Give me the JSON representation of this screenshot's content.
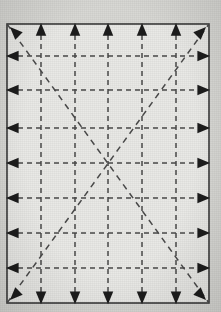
{
  "figure": {
    "canvas": {
      "width": 221,
      "height": 312
    },
    "colors": {
      "page_background": "#d8d8d4",
      "plot_background": "#e9e9e6",
      "border": "#3b3b3b",
      "grid_line": "#4a4a4a",
      "diagonal_line": "#4a4a4a",
      "arrow_fill": "#1d1d1d"
    },
    "frame": {
      "x": 7,
      "y": 24,
      "width": 202,
      "height": 279,
      "border_width": 1.6
    },
    "dash": {
      "pattern": "5 4",
      "width": 1.5
    },
    "diagonal_dash": {
      "pattern": "6 5",
      "width": 1.5
    },
    "grid": {
      "vertical_line_x": [
        41,
        75,
        108,
        142,
        176
      ],
      "horizontal_line_y": [
        56,
        90,
        128,
        163,
        198,
        233,
        268
      ],
      "vertical_count": 5,
      "horizontal_count": 7
    },
    "diagonals": [
      {
        "name": "diagonal-tl-br",
        "x1": 7,
        "y1": 24,
        "x2": 209,
        "y2": 303
      },
      {
        "name": "diagonal-bl-tr",
        "x1": 7,
        "y1": 303,
        "x2": 209,
        "y2": 24
      }
    ],
    "arrows": {
      "size": 7.5,
      "top": {
        "direction": "up",
        "count": 5,
        "glyph": "triangle-up"
      },
      "bottom": {
        "direction": "down",
        "count": 5,
        "glyph": "triangle-down"
      },
      "left": {
        "direction": "left",
        "count": 7,
        "glyph": "triangle-left"
      },
      "right": {
        "direction": "right",
        "count": 7,
        "glyph": "triangle-right"
      },
      "corners": [
        {
          "name": "corner-arrow-top-left",
          "direction": "up-left",
          "angle": 225
        },
        {
          "name": "corner-arrow-top-right",
          "direction": "up-right",
          "angle": 315
        },
        {
          "name": "corner-arrow-bottom-left",
          "direction": "down-left",
          "angle": 135
        },
        {
          "name": "corner-arrow-bottom-right",
          "direction": "down-right",
          "angle": 45
        }
      ]
    }
  }
}
